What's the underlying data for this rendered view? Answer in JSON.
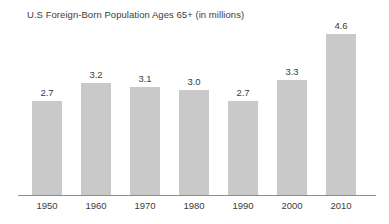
{
  "chart_data": {
    "type": "bar",
    "title": "U.S Foreign-Born Population Ages 65+ (in millions)",
    "xlabel": "",
    "ylabel": "",
    "ylim": [
      0,
      4.6
    ],
    "grid": false,
    "legend": "none",
    "bar_color": "#c9c9c9",
    "axis_color": "#8d8d8d",
    "text_color": "#3c3c3c",
    "categories": [
      "1950",
      "1960",
      "1970",
      "1980",
      "1990",
      "2000",
      "2010"
    ],
    "values": [
      2.7,
      3.2,
      3.1,
      3.0,
      2.7,
      3.3,
      4.6
    ],
    "value_labels": [
      "2.7",
      "3.2",
      "3.1",
      "3.0",
      "2.7",
      "3.3",
      "4.6"
    ]
  }
}
